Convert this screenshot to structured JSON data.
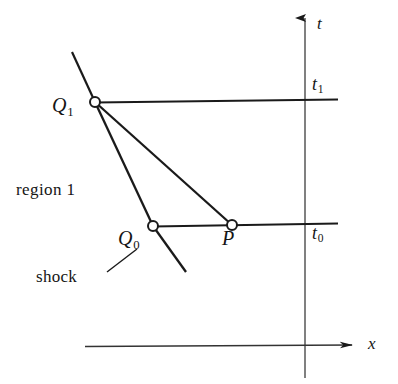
{
  "figure": {
    "background_color": "#ffffff",
    "stroke_color": "#1a1a1a",
    "width": 398,
    "height": 384
  },
  "axes": {
    "t_axis": {
      "label": "t",
      "orientation": "vertical",
      "arrow": "up",
      "x": 305,
      "y_top": 14,
      "y_bottom": 378
    },
    "x_axis": {
      "label": "x",
      "orientation": "horizontal",
      "arrow": "right",
      "y": 345,
      "x_left": 85,
      "x_right": 357
    }
  },
  "time_levels": [
    {
      "name": "t1",
      "label": "t",
      "subscript": "1",
      "y": 102,
      "x_start": 95,
      "x_end": 338
    },
    {
      "name": "t0",
      "label": "t",
      "subscript": "0",
      "y": 226,
      "x_start": 153,
      "x_end": 338
    }
  ],
  "points": [
    {
      "name": "Q1",
      "label": "Q",
      "subscript": "1",
      "x": 95,
      "y": 102
    },
    {
      "name": "Q0",
      "label": "Q",
      "subscript": "0",
      "x": 153,
      "y": 226
    },
    {
      "name": "P",
      "label": "P",
      "subscript": "",
      "x": 232,
      "y": 225
    }
  ],
  "curves": [
    {
      "name": "shock",
      "label": "shock",
      "description": "shock path through Q1 and Q0",
      "from": [
        72,
        52
      ],
      "through": [
        95,
        102,
        153,
        226
      ],
      "to": [
        186,
        272
      ]
    },
    {
      "name": "characteristic-Q1-Q0",
      "from": [
        95,
        102
      ],
      "to": [
        153,
        226
      ]
    },
    {
      "name": "characteristic-Q1-P",
      "from": [
        95,
        102
      ],
      "to": [
        232,
        225
      ]
    }
  ],
  "annotations": [
    {
      "name": "region-1",
      "text": "region 1",
      "x": 16,
      "y": 181
    },
    {
      "name": "shock-label",
      "text": "shock",
      "x": 36,
      "y": 268,
      "leader_from": [
        107,
        272
      ],
      "leader_to": [
        137,
        250
      ]
    }
  ]
}
